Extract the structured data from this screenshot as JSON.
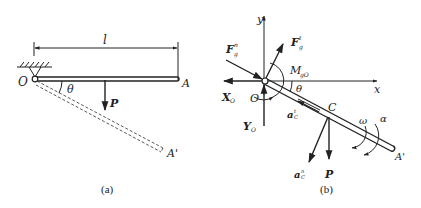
{
  "figure_a": {
    "caption": "(a)",
    "labels": {
      "length": "l",
      "pivot": "O",
      "end": "A",
      "end_rotated": "A'",
      "angle": "θ",
      "weight": "P"
    }
  },
  "figure_b": {
    "caption": "(b)",
    "labels": {
      "y_axis": "y",
      "x_axis": "x",
      "pivot": "O",
      "end_rotated": "A'",
      "center": "C",
      "angle": "θ",
      "inertia_force_normal": "F",
      "inertia_force_normal_sup": "n",
      "inertia_force_normal_sub": "g",
      "inertia_force_tangent": "F",
      "inertia_force_tangent_sup": "t",
      "inertia_force_tangent_sub": "g",
      "inertia_moment": "M",
      "inertia_moment_sub": "gO",
      "reaction_x": "X",
      "reaction_x_sub": "O",
      "reaction_y": "Y",
      "reaction_y_sub": "O",
      "accel_normal": "a",
      "accel_normal_sup": "n",
      "accel_normal_sub": "C",
      "accel_tangent": "a",
      "accel_tangent_sup": "t",
      "accel_tangent_sub": "C",
      "angular_velocity": "ω",
      "angular_acceleration": "α",
      "weight": "P"
    }
  }
}
